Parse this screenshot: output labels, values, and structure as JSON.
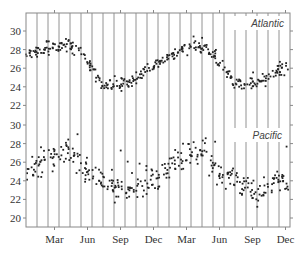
{
  "chart_data": {
    "type": "scatter",
    "title": "",
    "xlabel": "",
    "ylabel": "",
    "x_tick_labels": [
      "Mar",
      "Jun",
      "Sep",
      "Dec",
      "Mar",
      "Jun",
      "Sep",
      "Dec"
    ],
    "months_shown": 24,
    "vertical_gridlines": "monthly",
    "grid": true,
    "legend": "inline labels",
    "panels": [
      {
        "name": "Atlantic",
        "label": "Atlantic",
        "y_ticks": [
          22,
          24,
          26,
          28,
          30
        ],
        "ylim": [
          21.2,
          31.4
        ],
        "monthly_mean": [
          27.4,
          27.8,
          28.1,
          28.3,
          28.4,
          27.6,
          25.8,
          24.2,
          24.0,
          24.4,
          25.0,
          25.8,
          26.5,
          27.2,
          27.8,
          28.2,
          28.4,
          27.5,
          25.8,
          24.3,
          24.0,
          24.3,
          25.0,
          26.0
        ],
        "spread": 0.45
      },
      {
        "name": "Pacific",
        "label": "Pacific",
        "y_ticks": [
          20,
          22,
          24,
          26,
          28,
          30
        ],
        "ylim": [
          19.2,
          30.6
        ],
        "monthly_mean": [
          25.0,
          25.7,
          26.5,
          26.8,
          26.9,
          25.6,
          24.9,
          24.3,
          23.3,
          23.0,
          23.4,
          23.8,
          24.4,
          25.6,
          26.3,
          26.8,
          27.0,
          25.5,
          24.8,
          24.3,
          23.2,
          22.9,
          23.3,
          24.0
        ],
        "spread": 1.0
      }
    ]
  },
  "colors": {
    "points": "#222222",
    "gridlines": "#777777",
    "axis": "#888888",
    "text": "#333333"
  }
}
